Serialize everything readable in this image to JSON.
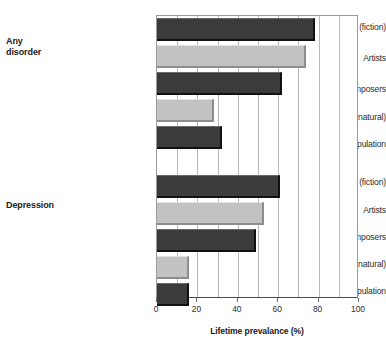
{
  "chart_data": {
    "type": "bar",
    "orientation": "horizontal",
    "title": "",
    "xlabel": "Lifetime prevalance (%)",
    "ylabel": "",
    "xlim": [
      0,
      100
    ],
    "xticks": [
      0,
      20,
      40,
      60,
      80,
      100
    ],
    "xtick_labels": [
      "0",
      "20",
      "40",
      "60",
      "80",
      "100"
    ],
    "grid": true,
    "grid_axis": "x",
    "legend": "none",
    "colors": {
      "dark_bar": "#3b3b3b",
      "light_bar": "#c2c2c2",
      "axis": "#9a9a9a",
      "gridline": "#b9b9b9",
      "text": "#2b2b2b"
    },
    "groups": [
      {
        "name": "Any disorder",
        "label_lines": [
          "Any",
          "disorder"
        ],
        "categories": [
          "Writers (fiction)",
          "Artists",
          "Composers",
          "Scientists (natural)",
          "General population"
        ],
        "values": [
          78,
          74,
          62,
          28,
          32
        ],
        "shades": [
          "dark",
          "light",
          "dark",
          "light",
          "dark"
        ]
      },
      {
        "name": "Depression",
        "label_lines": [
          "Depression"
        ],
        "categories": [
          "Writers (fiction)",
          "Artists",
          "Composers",
          "Scientists (natural)",
          "General population"
        ],
        "values": [
          61,
          53,
          49,
          16,
          16
        ],
        "shades": [
          "dark",
          "light",
          "dark",
          "light",
          "dark"
        ]
      }
    ]
  },
  "axis": {
    "x_title": "Lifetime prevalance (%)",
    "tick_labels": [
      "0",
      "20",
      "40",
      "60",
      "80",
      "100"
    ]
  },
  "groups": {
    "any_disorder": {
      "line1": "Any",
      "line2": "disorder"
    },
    "depression": {
      "line1": "Depression"
    }
  },
  "categories": {
    "any": [
      "Writers (fiction)",
      "Artists",
      "Composers",
      "Scientists (natural)",
      "General population"
    ],
    "dep": [
      "Writers (fiction)",
      "Artists",
      "Composers",
      "Scientists (natural)",
      "General population"
    ]
  }
}
